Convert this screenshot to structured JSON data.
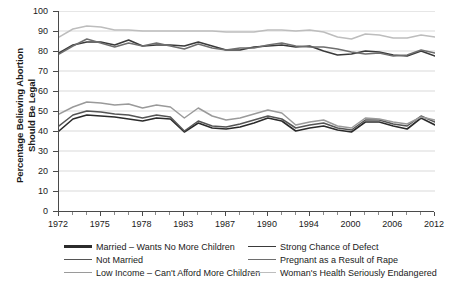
{
  "chart_data": {
    "type": "line",
    "title": "",
    "xlabel": "",
    "ylabel": "Percentage Believing Abortion Should Be Legal",
    "ylabel_line1": "Percentage Believing Abortion",
    "ylabel_line2": "Should Be Legal",
    "ylim": [
      0,
      100
    ],
    "ytick_values": [
      0,
      10,
      20,
      30,
      40,
      50,
      60,
      70,
      80,
      90,
      100
    ],
    "grid": true,
    "grid_axis": "y",
    "legend_position": "below",
    "x": [
      1972,
      1973,
      1974,
      1975,
      1976,
      1977,
      1978,
      1980,
      1982,
      1983,
      1984,
      1985,
      1987,
      1988,
      1989,
      1990,
      1991,
      1993,
      1994,
      1996,
      1998,
      2000,
      2002,
      2004,
      2006,
      2008,
      2010,
      2012
    ],
    "xtick_labels": [
      "1972",
      "1975",
      "1978",
      "1983",
      "1987",
      "1990",
      "1994",
      "2000",
      "2006",
      "2012"
    ],
    "xtick_index": [
      0,
      3,
      6,
      9,
      12,
      15,
      18,
      21,
      24,
      27
    ],
    "series": [
      {
        "name": "Married – Wants No More Children",
        "color": "#2b2b2b",
        "width": 1.6,
        "values": [
          40,
          46,
          48,
          47.5,
          47,
          46,
          45,
          46.5,
          46,
          39.5,
          44,
          41.5,
          41,
          42,
          44,
          46.5,
          45,
          40,
          41.5,
          42.5,
          40.5,
          39.5,
          44.5,
          44.5,
          42.5,
          41,
          46.5,
          43
        ]
      },
      {
        "name": "Not Married",
        "color": "#555555",
        "width": 1.5,
        "values": [
          42.5,
          48,
          50,
          49.5,
          48.5,
          48,
          46.5,
          48,
          47,
          40,
          45,
          42.5,
          42,
          43.5,
          45.5,
          47.5,
          46,
          41.5,
          43,
          44,
          41.5,
          40.5,
          45.5,
          45.5,
          43.5,
          42.5,
          47.5,
          44.5
        ]
      },
      {
        "name": "Low Income – Can't Afford More Children",
        "color": "#9a9a9a",
        "width": 1.5,
        "values": [
          48.5,
          52,
          54.5,
          54,
          53,
          53.5,
          51.5,
          53,
          52,
          46.5,
          51.5,
          47.5,
          45.5,
          46.5,
          48.5,
          50.5,
          49,
          43,
          44.5,
          45.5,
          42.5,
          41.5,
          46.5,
          46,
          44.5,
          43.5,
          47,
          45.5
        ]
      },
      {
        "name": "Strong Chance of Defect",
        "color": "#3a3a3a",
        "width": 1.6,
        "values": [
          79,
          83,
          84.5,
          84.5,
          83,
          85.5,
          82.5,
          83,
          83,
          82.5,
          84.5,
          82.5,
          80.5,
          80.5,
          82,
          82.5,
          83,
          82,
          82.5,
          80,
          78,
          78.5,
          80,
          79.5,
          78,
          77.5,
          80,
          77.5
        ]
      },
      {
        "name": "Pregnant as a Result of Rape",
        "color": "#6e6e6e",
        "width": 1.5,
        "values": [
          78.5,
          82.5,
          86,
          84,
          82,
          84,
          82.5,
          84,
          82.5,
          81,
          83.5,
          81.5,
          80.5,
          81.5,
          81.5,
          83,
          84,
          82.5,
          82,
          82,
          81,
          79.5,
          78.5,
          79,
          77.5,
          78,
          80.5,
          79
        ]
      },
      {
        "name": "Woman's Health Seriously Endangered",
        "color": "#bdbdbd",
        "width": 1.5,
        "values": [
          87,
          91,
          92.5,
          92,
          90.5,
          90.5,
          90,
          90,
          90,
          90,
          90,
          90,
          89.5,
          89.5,
          89.5,
          90.5,
          90.5,
          90,
          90.5,
          89.5,
          87,
          86,
          88.5,
          88,
          86.5,
          86.5,
          88,
          87
        ]
      }
    ]
  },
  "legend": {
    "left_column": [
      {
        "label": "Married – Wants No More Children",
        "color": "#2b2b2b",
        "thickness": "2.4px"
      },
      {
        "label": "Not Married",
        "color": "#555555",
        "thickness": "1.8px"
      },
      {
        "label": "Low Income – Can't Afford More Children",
        "color": "#9a9a9a",
        "thickness": "1.4px"
      }
    ],
    "right_column": [
      {
        "label": "Strong Chance of Defect",
        "color": "#3a3a3a",
        "thickness": "1.8px"
      },
      {
        "label": "Pregnant as a Result of Rape",
        "color": "#6e6e6e",
        "thickness": "1.6px"
      },
      {
        "label": "Woman's Health Seriously Endangered",
        "color": "#bdbdbd",
        "thickness": "1.4px"
      }
    ]
  },
  "style": {
    "background": "#ffffff",
    "grid_color": "#c8c8c8",
    "axis_color": "#4a4a4a",
    "text_color": "#1a1a1a"
  }
}
